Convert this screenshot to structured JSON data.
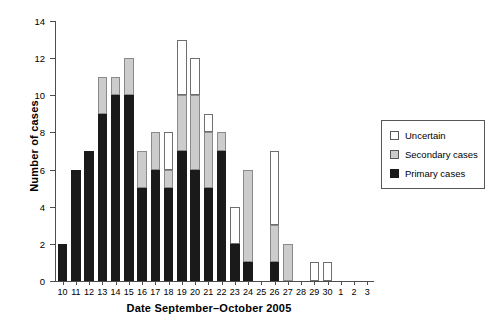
{
  "chart_data": {
    "type": "bar",
    "subtype": "stacked-bar",
    "title": "",
    "xlabel": "Date September–October 2005",
    "ylabel": "Number of cases",
    "ylim": [
      0,
      14
    ],
    "yticks": [
      0,
      2,
      4,
      6,
      8,
      10,
      12,
      14
    ],
    "grid": false,
    "legend_position": "right-outside",
    "categories": [
      "10",
      "11",
      "12",
      "13",
      "14",
      "15",
      "16",
      "17",
      "18",
      "19",
      "20",
      "21",
      "22",
      "23",
      "24",
      "25",
      "26",
      "27",
      "28",
      "29",
      "30",
      "1",
      "2",
      "3"
    ],
    "series": [
      {
        "name": "Primary cases",
        "color": "#1a1a1a",
        "values": [
          2,
          6,
          7,
          9,
          10,
          10,
          5,
          6,
          5,
          7,
          6,
          5,
          7,
          2,
          1,
          0,
          1,
          0,
          0,
          0,
          0,
          0,
          0,
          0
        ]
      },
      {
        "name": "Secondary cases",
        "color": "#cccccc",
        "values": [
          0,
          0,
          0,
          2,
          1,
          2,
          2,
          2,
          1,
          3,
          4,
          3,
          1,
          0,
          5,
          0,
          2,
          2,
          0,
          0,
          0,
          0,
          0,
          0
        ]
      },
      {
        "name": "Uncertain",
        "color": "#ffffff",
        "values": [
          0,
          0,
          0,
          0,
          0,
          0,
          0,
          0,
          2,
          3,
          2,
          1,
          0,
          2,
          0,
          0,
          4,
          0,
          0,
          1,
          1,
          0,
          0,
          0
        ]
      }
    ],
    "totals": [
      2,
      6,
      7,
      11,
      11,
      12,
      7,
      8,
      8,
      13,
      12,
      9,
      8,
      4,
      6,
      0,
      7,
      2,
      0,
      1,
      1,
      0,
      0,
      0
    ]
  },
  "legend": {
    "items": [
      {
        "label": "Uncertain",
        "swatch": "uncertain"
      },
      {
        "label": "Secondary cases",
        "swatch": "secondary"
      },
      {
        "label": "Primary cases",
        "swatch": "primary"
      }
    ]
  }
}
